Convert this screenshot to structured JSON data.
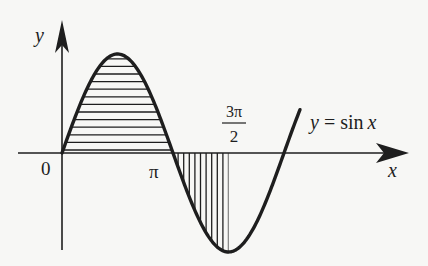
{
  "diagram": {
    "curve_label": "y = sin x",
    "curve_label_parts": {
      "y": "y",
      "eq": " = sin",
      "x": "x"
    },
    "axes": {
      "x_label": "x",
      "y_label": "y",
      "origin_label": "0"
    },
    "ticks": {
      "pi": "π",
      "three_pi_over_two_num": "3π",
      "three_pi_over_two_den": "2"
    },
    "regions": [
      {
        "name": "positive-lobe",
        "range": "0 to π",
        "hatch": "horizontal"
      },
      {
        "name": "negative-lobe",
        "range": "π to 3π/2",
        "hatch": "vertical"
      }
    ],
    "colors": {
      "ink": "#1e1e1e",
      "background": "#f7f7f5"
    }
  }
}
